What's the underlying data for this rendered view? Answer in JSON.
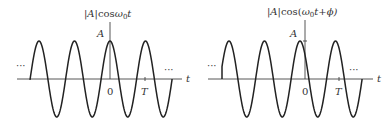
{
  "panels": [
    {
      "id": "left",
      "title": "|A|cosω₀t",
      "title_parts": {
        "abs": "|A|",
        "fn": "cos",
        "arg": "ω",
        "sub": "0",
        "tail": "t"
      },
      "amplitude_label": "A",
      "origin_label": "0",
      "period_label": "T",
      "axis_label": "t",
      "ellipsis_left": "···",
      "ellipsis_right": "···",
      "geom": {
        "x_axis_y": 79,
        "x_start": 17,
        "x_end": 182,
        "y_axis_x": 110,
        "y_top": 22,
        "amp": 38,
        "period": 35.5,
        "peak_x": 110,
        "wave_start": 30,
        "wave_end": 172,
        "t_tick_x": 145
      }
    },
    {
      "id": "right",
      "title": "|A|cos(ω₀t+ϕ)",
      "title_parts": {
        "abs": "|A|",
        "fn": "cos(",
        "arg": "ω",
        "sub": "0",
        "tail": "t+ϕ)"
      },
      "amplitude_label": "A",
      "origin_label": "0",
      "period_label": "T",
      "axis_label": "t",
      "ellipsis_left": "···",
      "ellipsis_right": "···",
      "geom": {
        "x_axis_y": 79,
        "x_start": 208,
        "x_end": 373,
        "y_axis_x": 305,
        "y_top": 20,
        "amp": 38,
        "period": 35.5,
        "peak_x": 300,
        "wave_start": 222,
        "wave_end": 362,
        "t_tick_x": 339
      }
    }
  ],
  "colors": {
    "stroke": "#222222",
    "axis": "#444444",
    "text": "#333333"
  }
}
